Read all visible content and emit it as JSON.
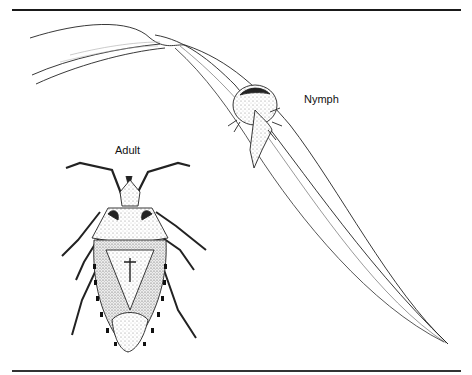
{
  "figure": {
    "labels": {
      "nymph": "Nymph",
      "adult": "Adult"
    },
    "subjects": [
      {
        "name": "nymph",
        "description": "insect nymph perched on a grass blade"
      },
      {
        "name": "adult",
        "description": "adult shield-shaped bug, dorsal view, banded abdominal margin"
      }
    ],
    "colors": {
      "ink": "#1a1a1a",
      "background": "#ffffff",
      "stipple": "#888888"
    }
  }
}
